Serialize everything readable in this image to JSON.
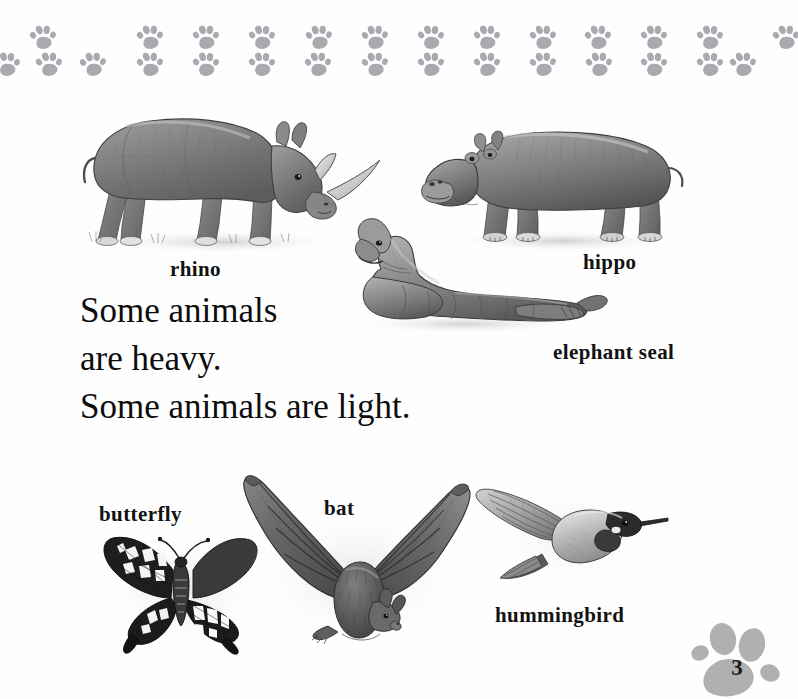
{
  "page": {
    "number": "3",
    "background_color": "#fefefe",
    "border_paw_color": "#a8aab0",
    "page_badge_color": "#b0b0b0"
  },
  "border": {
    "icon": "paw-print-icon",
    "repeat_count": 17,
    "rows": 2
  },
  "body_text": {
    "lines": [
      "Some animals",
      "are heavy.",
      "Some animals are light."
    ]
  },
  "figures": [
    {
      "name": "rhino",
      "label": "rhino",
      "icon": "rhino-illustration"
    },
    {
      "name": "hippo",
      "label": "hippo",
      "icon": "hippo-illustration"
    },
    {
      "name": "elephant-seal",
      "label": "elephant seal",
      "icon": "elephant-seal-illustration"
    },
    {
      "name": "butterfly",
      "label": "butterfly",
      "icon": "butterfly-illustration"
    },
    {
      "name": "bat",
      "label": "bat",
      "icon": "bat-illustration"
    },
    {
      "name": "hummingbird",
      "label": "hummingbird",
      "icon": "hummingbird-illustration"
    }
  ]
}
